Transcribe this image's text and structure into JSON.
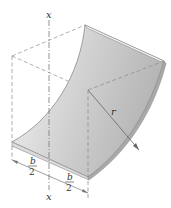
{
  "figure": {
    "labels": {
      "axis_top": "x",
      "axis_bottom": "x",
      "radius": "r",
      "half_width_left_num": "b",
      "half_width_left_den": "2",
      "half_width_right_num": "b",
      "half_width_right_den": "2"
    },
    "colors": {
      "shell_light": "#e8e8e8",
      "shell_dark": "#b9b9b9",
      "edge": "#8a8a8a",
      "dash": "#999999",
      "text": "#333333"
    }
  }
}
